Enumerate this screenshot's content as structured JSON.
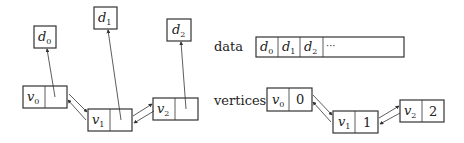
{
  "left_diagram": {
    "data_nodes": [
      {
        "label": "d",
        "sub": "0"
      },
      {
        "label": "d",
        "sub": "1"
      },
      {
        "label": "d",
        "sub": "2"
      }
    ],
    "vertex_nodes": [
      {
        "label": "v",
        "sub": "0"
      },
      {
        "label": "v",
        "sub": "1"
      },
      {
        "label": "v",
        "sub": "2"
      }
    ]
  },
  "right_diagram": {
    "data_label": "data",
    "data_cells": [
      {
        "label": "d",
        "sub": "0"
      },
      {
        "label": "d",
        "sub": "1"
      },
      {
        "label": "d",
        "sub": "2"
      }
    ],
    "data_ellipsis": "···",
    "vertices_label": "vertices",
    "vertex_nodes": [
      {
        "label": "v",
        "sub": "0",
        "index": "0"
      },
      {
        "label": "v",
        "sub": "1",
        "index": "1"
      },
      {
        "label": "v",
        "sub": "2",
        "index": "2"
      }
    ]
  }
}
